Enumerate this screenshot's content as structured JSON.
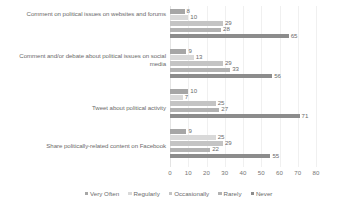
{
  "chart_data": {
    "type": "bar",
    "orientation": "horizontal",
    "title": "",
    "xlabel": "",
    "ylabel": "",
    "xlim": [
      0,
      80
    ],
    "xticks": [
      "0",
      "10",
      "20",
      "30",
      "40",
      "50",
      "60",
      "70",
      "80"
    ],
    "grid": true,
    "legend_position": "bottom",
    "categories": [
      "Comment on political issues on websites and forums",
      "Comment and/or debate about political issues on social media",
      "Tweet about political activity",
      "Share politically-related content on Facebook"
    ],
    "series": [
      {
        "name": "Very Often",
        "color": "#a6a6a6",
        "values": [
          8,
          9,
          10,
          9
        ]
      },
      {
        "name": "Regularly",
        "color": "#d9d9d9",
        "values": [
          10,
          13,
          7,
          25
        ]
      },
      {
        "name": "Occasionally",
        "color": "#c4c4c4",
        "values": [
          29,
          29,
          25,
          29
        ]
      },
      {
        "name": "Rarely",
        "color": "#b2b2b2",
        "values": [
          28,
          33,
          27,
          22
        ]
      },
      {
        "name": "Never",
        "color": "#8c8c8c",
        "values": [
          65,
          56,
          71,
          55
        ]
      }
    ]
  },
  "colors": {
    "gridline": "#f0f0f0",
    "axis": "#e4e4e4",
    "text": "#6b6b6b",
    "background": "#ffffff"
  }
}
